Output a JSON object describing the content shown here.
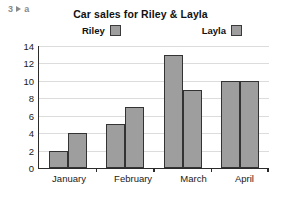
{
  "exercise": {
    "number": "3",
    "arrow_icon": "play-triangle-icon",
    "part": "a"
  },
  "chart_data": {
    "type": "bar",
    "title": "Car sales for Riley & Layla",
    "xlabel": "",
    "ylabel": "",
    "categories": [
      "January",
      "February",
      "March",
      "April"
    ],
    "series": [
      {
        "name": "Riley",
        "values": [
          2,
          5,
          13,
          10
        ],
        "color": "#9e9e9e"
      },
      {
        "name": "Layla",
        "values": [
          4,
          7,
          9,
          10
        ],
        "color": "#9e9e9e"
      }
    ],
    "ylim": [
      0,
      14
    ],
    "ytick_step": 2,
    "yticks": [
      0,
      2,
      4,
      6,
      8,
      10,
      12,
      14
    ],
    "grid": true,
    "legend_position": "top",
    "bar_border_color": "#333333",
    "axis_color": "#2b2b2b",
    "gridline_color": "#dcdcdc",
    "background": "#ffffff"
  }
}
